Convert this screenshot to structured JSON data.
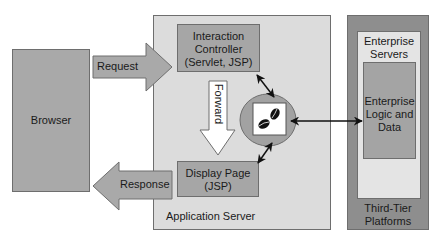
{
  "diagram": {
    "browser": {
      "label": "Browser"
    },
    "request_arrow": {
      "label": "Request"
    },
    "response_arrow": {
      "label": "Response"
    },
    "application_server": {
      "label": "Application Server",
      "interaction_controller": {
        "line1": "Interaction",
        "line2": "Controller",
        "line3": "(Servlet, JSP)"
      },
      "forward_arrow": {
        "label": "Forward"
      },
      "display_page": {
        "line1": "Display Page",
        "line2": "(JSP)"
      },
      "bean_icon": "coffee-beans-icon"
    },
    "third_tier": {
      "label_line1": "Third-Tier",
      "label_line2": "Platforms",
      "enterprise_servers": {
        "line1": "Enterprise",
        "line2": "Servers"
      },
      "enterprise_logic": {
        "line1": "Enterprise",
        "line2": "Logic and",
        "line3": "Data"
      }
    },
    "colors": {
      "browser_fill": "#a9a9a9",
      "app_server_fill": "#dcdcdc",
      "component_fill": "#a6a6a6",
      "third_tier_fill": "#8e8e8e",
      "enterprise_servers_fill": "#e4e4e4",
      "enterprise_logic_fill": "#a4a4a4",
      "circle_fill": "#a2a2a2",
      "forward_arrow_fill": "#ffffff"
    }
  }
}
